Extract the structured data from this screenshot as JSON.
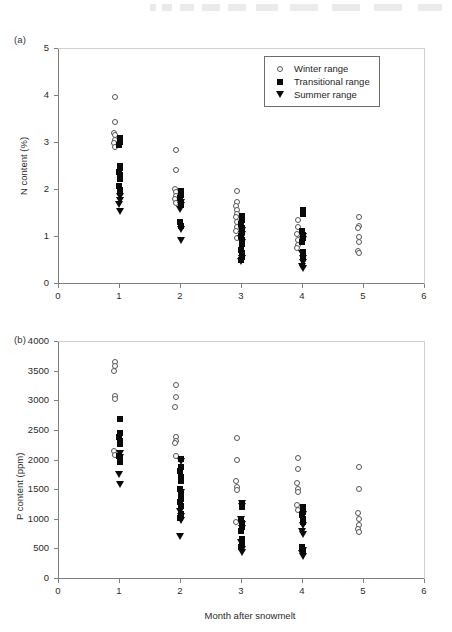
{
  "figure": {
    "panel_a_label": "(a)",
    "panel_b_label": "(b)",
    "xlabel": "Month after snowmelt"
  },
  "legend": {
    "items": [
      {
        "symbol": "open-circle",
        "label": "Winter range"
      },
      {
        "symbol": "filled-square",
        "label": "Transitional range"
      },
      {
        "symbol": "filled-triangle-down",
        "label": "Summer range"
      }
    ]
  },
  "chart_data": [
    {
      "type": "scatter",
      "panel": "(a)",
      "title": "",
      "xlabel": "Month after snowmelt",
      "ylabel": "N content (%)",
      "xlim": [
        0,
        6
      ],
      "ylim": [
        0,
        5
      ],
      "xticks": [
        0,
        1,
        2,
        3,
        4,
        5,
        6
      ],
      "yticks": [
        0,
        1,
        2,
        3,
        4,
        5
      ],
      "xtick_labels": [
        "0",
        "1",
        "2",
        "3",
        "4",
        "5",
        "6"
      ],
      "ytick_labels": [
        "0",
        "1",
        "2",
        "3",
        "4",
        "5"
      ],
      "grid": false,
      "legend_position": "top-right",
      "series": [
        {
          "name": "Winter range",
          "symbol": "open-circle",
          "points": [
            [
              1,
              3.95
            ],
            [
              1,
              3.42
            ],
            [
              1,
              3.2
            ],
            [
              1,
              3.14
            ],
            [
              1,
              3.05
            ],
            [
              1,
              2.97
            ],
            [
              1,
              2.9
            ],
            [
              2,
              2.84
            ],
            [
              2,
              2.4
            ],
            [
              2,
              2.0
            ],
            [
              2,
              1.93
            ],
            [
              2,
              1.86
            ],
            [
              2,
              1.78
            ],
            [
              2,
              1.7
            ],
            [
              3,
              1.95
            ],
            [
              3,
              1.72
            ],
            [
              3,
              1.63
            ],
            [
              3,
              1.55
            ],
            [
              3,
              1.47
            ],
            [
              3,
              1.4
            ],
            [
              3,
              1.3
            ],
            [
              3,
              1.2
            ],
            [
              3,
              1.1
            ],
            [
              3,
              0.95
            ],
            [
              4,
              1.35
            ],
            [
              4,
              1.2
            ],
            [
              4,
              1.05
            ],
            [
              4,
              0.92
            ],
            [
              4,
              0.8
            ],
            [
              4,
              0.74
            ],
            [
              5,
              1.41
            ],
            [
              5,
              1.22
            ],
            [
              5,
              1.16
            ],
            [
              5,
              0.97
            ],
            [
              5,
              0.88
            ],
            [
              5,
              0.69
            ],
            [
              5,
              0.63
            ]
          ]
        },
        {
          "name": "Transitional range",
          "symbol": "filled-square",
          "points": [
            [
              1,
              3.08
            ],
            [
              1,
              3.0
            ],
            [
              1,
              2.93
            ],
            [
              1,
              2.5
            ],
            [
              1,
              2.44
            ],
            [
              1,
              2.37
            ],
            [
              1,
              2.3
            ],
            [
              1,
              2.22
            ],
            [
              1,
              2.06
            ],
            [
              1,
              1.98
            ],
            [
              2,
              1.95
            ],
            [
              2,
              1.88
            ],
            [
              2,
              1.8
            ],
            [
              2,
              1.73
            ],
            [
              2,
              1.66
            ],
            [
              2,
              1.3
            ],
            [
              2,
              1.22
            ],
            [
              3,
              1.42
            ],
            [
              3,
              1.33
            ],
            [
              3,
              1.25
            ],
            [
              3,
              1.16
            ],
            [
              3,
              1.08
            ],
            [
              3,
              1.0
            ],
            [
              3,
              0.92
            ],
            [
              3,
              0.84
            ],
            [
              3,
              0.7
            ],
            [
              3,
              0.64
            ],
            [
              3,
              0.56
            ],
            [
              3,
              0.48
            ],
            [
              4,
              1.55
            ],
            [
              4,
              1.47
            ],
            [
              4,
              1.1
            ],
            [
              4,
              1.02
            ],
            [
              4,
              0.96
            ],
            [
              4,
              0.88
            ],
            [
              4,
              0.66
            ],
            [
              4,
              0.58
            ]
          ]
        },
        {
          "name": "Summer range",
          "symbol": "filled-triangle-down",
          "points": [
            [
              1,
              1.85
            ],
            [
              1,
              1.76
            ],
            [
              1,
              1.68
            ],
            [
              1,
              1.52
            ],
            [
              2,
              1.72
            ],
            [
              2,
              1.64
            ],
            [
              2,
              1.56
            ],
            [
              2,
              1.13
            ],
            [
              2,
              0.9
            ],
            [
              3,
              1.12
            ],
            [
              3,
              1.03
            ],
            [
              3,
              0.95
            ],
            [
              3,
              0.86
            ],
            [
              3,
              0.52
            ],
            [
              3,
              0.45
            ],
            [
              4,
              1.0
            ],
            [
              4,
              0.92
            ],
            [
              4,
              0.62
            ],
            [
              4,
              0.52
            ],
            [
              4,
              0.44
            ],
            [
              4,
              0.36
            ],
            [
              4,
              0.3
            ]
          ]
        }
      ]
    },
    {
      "type": "scatter",
      "panel": "(b)",
      "title": "",
      "xlabel": "Month after snowmelt",
      "ylabel": "P content (ppm)",
      "xlim": [
        0,
        6
      ],
      "ylim": [
        0,
        4000
      ],
      "xticks": [
        0,
        1,
        2,
        3,
        4,
        5,
        6
      ],
      "yticks": [
        0,
        500,
        1000,
        1500,
        2000,
        2500,
        3000,
        3500,
        4000
      ],
      "xtick_labels": [
        "0",
        "1",
        "2",
        "3",
        "4",
        "5",
        "6"
      ],
      "ytick_labels": [
        "0",
        "500",
        "1000",
        "1500",
        "2000",
        "2500",
        "3000",
        "3500",
        "4000"
      ],
      "grid": false,
      "legend_position": "none",
      "series": [
        {
          "name": "Winter range",
          "symbol": "open-circle",
          "points": [
            [
              1,
              3640
            ],
            [
              1,
              3570
            ],
            [
              1,
              3500
            ],
            [
              1,
              3080
            ],
            [
              1,
              3020
            ],
            [
              1,
              2150
            ],
            [
              1,
              2080
            ],
            [
              2,
              3250
            ],
            [
              2,
              3050
            ],
            [
              2,
              2880
            ],
            [
              2,
              2380
            ],
            [
              2,
              2320
            ],
            [
              2,
              2280
            ],
            [
              2,
              2060
            ],
            [
              3,
              2360
            ],
            [
              3,
              2000
            ],
            [
              3,
              1640
            ],
            [
              3,
              1540
            ],
            [
              3,
              1480
            ],
            [
              3,
              950
            ],
            [
              4,
              2030
            ],
            [
              4,
              1840
            ],
            [
              4,
              1600
            ],
            [
              4,
              1510
            ],
            [
              4,
              1450
            ],
            [
              4,
              1240
            ],
            [
              4,
              1150
            ],
            [
              5,
              1870
            ],
            [
              5,
              1500
            ],
            [
              5,
              1090
            ],
            [
              5,
              990
            ],
            [
              5,
              900
            ],
            [
              5,
              820
            ],
            [
              5,
              770
            ]
          ]
        },
        {
          "name": "Transitional range",
          "symbol": "filled-square",
          "points": [
            [
              1,
              2680
            ],
            [
              1,
              2440
            ],
            [
              1,
              2380
            ],
            [
              1,
              2320
            ],
            [
              1,
              2260
            ],
            [
              1,
              2060
            ],
            [
              1,
              2010
            ],
            [
              1,
              1960
            ],
            [
              2,
              2010
            ],
            [
              2,
              1870
            ],
            [
              2,
              1800
            ],
            [
              2,
              1700
            ],
            [
              2,
              1640
            ],
            [
              2,
              1500
            ],
            [
              2,
              1420
            ],
            [
              2,
              1340
            ],
            [
              2,
              1280
            ],
            [
              2,
              1220
            ],
            [
              2,
              1080
            ],
            [
              2,
              1020
            ],
            [
              3,
              1260
            ],
            [
              3,
              1190
            ],
            [
              3,
              1000
            ],
            [
              3,
              930
            ],
            [
              3,
              860
            ],
            [
              3,
              800
            ],
            [
              3,
              650
            ],
            [
              3,
              580
            ],
            [
              3,
              520
            ],
            [
              4,
              1190
            ],
            [
              4,
              1120
            ],
            [
              4,
              1060
            ],
            [
              4,
              1000
            ],
            [
              4,
              940
            ],
            [
              4,
              520
            ],
            [
              4,
              460
            ]
          ]
        },
        {
          "name": "Summer range",
          "symbol": "filled-triangle-down",
          "points": [
            [
              1,
              2100
            ],
            [
              1,
              2030
            ],
            [
              1,
              1750
            ],
            [
              1,
              1580
            ],
            [
              2,
              1960
            ],
            [
              2,
              1440
            ],
            [
              2,
              1120
            ],
            [
              2,
              1040
            ],
            [
              2,
              970
            ],
            [
              2,
              700
            ],
            [
              3,
              1250
            ],
            [
              3,
              1200
            ],
            [
              3,
              990
            ],
            [
              3,
              900
            ],
            [
              3,
              840
            ],
            [
              3,
              600
            ],
            [
              3,
              480
            ],
            [
              3,
              430
            ],
            [
              4,
              1080
            ],
            [
              4,
              880
            ],
            [
              4,
              780
            ],
            [
              4,
              740
            ],
            [
              4,
              470
            ],
            [
              4,
              420
            ],
            [
              4,
              370
            ]
          ]
        }
      ]
    }
  ]
}
